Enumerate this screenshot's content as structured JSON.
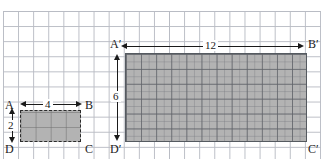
{
  "figure": {
    "background": "graph-paper-grid",
    "grid_spacing_px": 15,
    "fill_color": "#b3b3b3",
    "line_color": "#1a1a1a"
  },
  "shapes": {
    "small_rectangle": {
      "name": "ABCD",
      "border_style": "dashed",
      "width_units": 4,
      "height_units": 2,
      "corners": {
        "top_left": "A",
        "top_right": "B",
        "bottom_right": "C",
        "bottom_left": "D"
      }
    },
    "large_rectangle": {
      "name": "A'B'C'D'",
      "border_style": "solid",
      "width_units": 12,
      "height_units": 6,
      "corners": {
        "top_left": "A′",
        "top_right": "B′",
        "bottom_right": "C′",
        "bottom_left": "D′"
      }
    }
  },
  "dimensions": {
    "small_width_label": "4",
    "small_height_label": "2",
    "large_width_label": "12",
    "large_height_label": "6"
  },
  "chart_data": {
    "type": "diagram",
    "series": [
      {
        "name": "ABCD",
        "width": 4,
        "height": 2,
        "vertices": [
          "A",
          "B",
          "C",
          "D"
        ]
      },
      {
        "name": "A'B'C'D'",
        "width": 12,
        "height": 6,
        "vertices": [
          "A′",
          "B′",
          "C′",
          "D′"
        ]
      }
    ],
    "scale_factor": 3,
    "grid": true,
    "xlabel": "",
    "ylabel": ""
  }
}
